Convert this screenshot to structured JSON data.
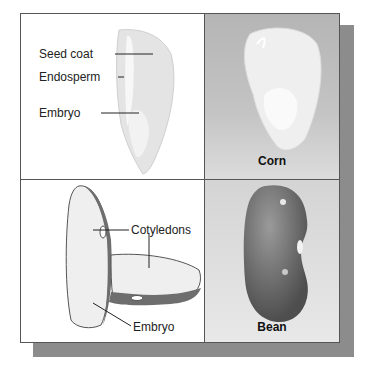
{
  "panels": {
    "corn_section": {
      "labels": [
        "Seed coat",
        "Endosperm",
        "Embryo"
      ]
    },
    "corn_whole": {
      "caption": "Corn"
    },
    "bean_section": {
      "labels": [
        "Cotyledons",
        "Embryo"
      ]
    },
    "bean_whole": {
      "caption": "Bean"
    }
  }
}
